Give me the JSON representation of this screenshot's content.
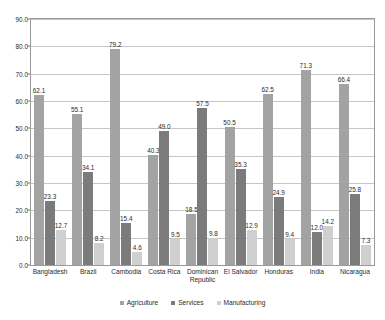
{
  "chart_data": {
    "type": "bar",
    "title": "",
    "subtitle": "",
    "xlabel": "",
    "ylabel": "",
    "ylim": [
      0.0,
      90.0
    ],
    "ytick_step": 10.0,
    "yticks": [
      "0.0",
      "10.0",
      "20.0",
      "30.0",
      "40.0",
      "50.0",
      "60.0",
      "70.0",
      "80.0",
      "90.0"
    ],
    "grid": true,
    "legend_position": "bottom-center",
    "categories": [
      "Bangladesh",
      "Brazil",
      "Cambodia",
      "Costa Rica",
      "Dominican\nRepublic",
      "El Salvador",
      "Honduras",
      "India",
      "Nicaragua"
    ],
    "series": [
      {
        "name": "Agriculture",
        "color": "#a3a3a3",
        "values": [
          62.1,
          55.1,
          79.2,
          40.3,
          18.5,
          50.5,
          62.5,
          71.3,
          66.4
        ],
        "labels": [
          "62.1",
          "55.1",
          "79.2",
          "40.3",
          "18.5",
          "50.5",
          "62.5",
          "71.3",
          "66.4"
        ]
      },
      {
        "name": "Services",
        "color": "#7b7b7b",
        "values": [
          23.3,
          34.1,
          15.4,
          49.0,
          57.5,
          35.3,
          24.9,
          12.0,
          25.8
        ],
        "labels": [
          "23.3",
          "34.1",
          "15.4",
          "49.0",
          "57.5",
          "35.3",
          "24.9",
          "12.0",
          "25.8"
        ]
      },
      {
        "name": "Manufacturing",
        "color": "#cfcfcf",
        "values": [
          12.7,
          8.2,
          4.6,
          9.5,
          9.8,
          12.9,
          9.4,
          14.2,
          7.3
        ],
        "labels": [
          "12.7",
          "8.2",
          "4.6",
          "9.5",
          "9.8",
          "12.9",
          "9.4",
          "14.2",
          "7.3"
        ]
      }
    ]
  },
  "legend": {
    "items": [
      {
        "label": "Agriculture"
      },
      {
        "label": "Services"
      },
      {
        "label": "Manufacturing"
      }
    ]
  }
}
